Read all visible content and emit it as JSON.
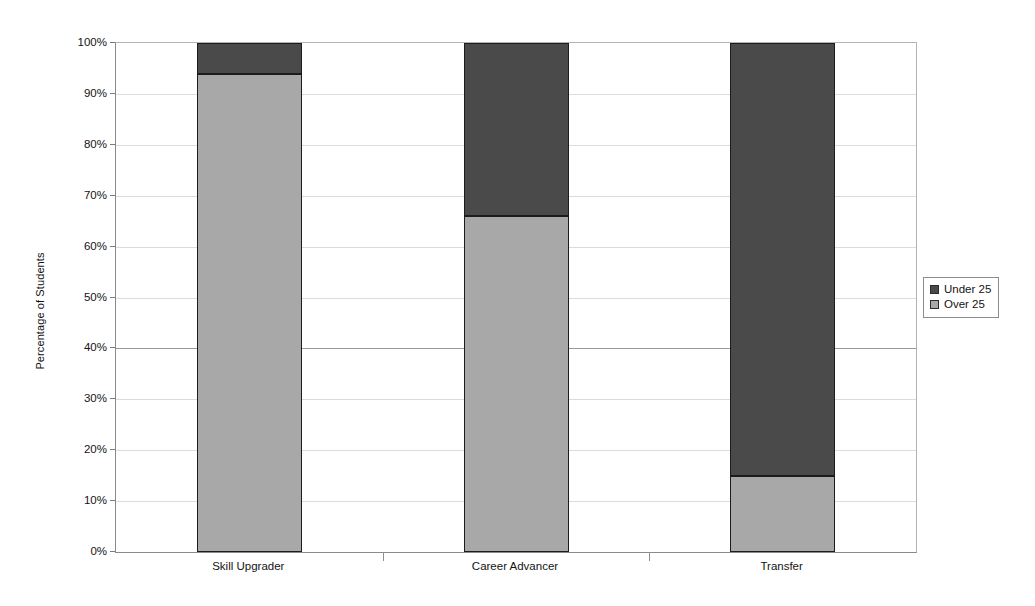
{
  "chart_data": {
    "type": "bar",
    "subtype": "stacked-100-percent",
    "title": "",
    "xlabel": "",
    "ylabel": "Percentage of Students",
    "categories": [
      "Skill Upgrader",
      "Career Advancer",
      "Transfer"
    ],
    "series": [
      {
        "name": "Under 25",
        "color": "#4a4a4a",
        "values": [
          6,
          34,
          85
        ]
      },
      {
        "name": "Over 25",
        "color": "#a8a8a8",
        "values": [
          94,
          66,
          15
        ]
      }
    ],
    "ylim": [
      0,
      100
    ],
    "y_tick_values": [
      0,
      10,
      20,
      30,
      40,
      50,
      60,
      70,
      80,
      90,
      100
    ],
    "y_tick_labels": [
      "0%",
      "10%",
      "20%",
      "30%",
      "40%",
      "50%",
      "60%",
      "70%",
      "80%",
      "90%",
      "100%"
    ],
    "grid": true,
    "grid_axis": "y",
    "legend_position": "right",
    "legend_entries": [
      "Under 25",
      "Over 25"
    ],
    "stack_order_bottom_to_top": [
      "Over 25",
      "Under 25"
    ]
  },
  "axes": {
    "y_title": "Percentage of Students",
    "y_ticks": [
      {
        "label": "100%",
        "value": 100
      },
      {
        "label": "90%",
        "value": 90
      },
      {
        "label": "80%",
        "value": 80
      },
      {
        "label": "70%",
        "value": 70
      },
      {
        "label": "60%",
        "value": 60
      },
      {
        "label": "50%",
        "value": 50
      },
      {
        "label": "40%",
        "value": 40
      },
      {
        "label": "30%",
        "value": 30
      },
      {
        "label": "20%",
        "value": 20
      },
      {
        "label": "10%",
        "value": 10
      },
      {
        "label": "0%",
        "value": 0
      }
    ],
    "x_ticks": [
      {
        "label": "Skill Upgrader"
      },
      {
        "label": "Career Advancer"
      },
      {
        "label": "Transfer"
      }
    ]
  },
  "legend": {
    "items": [
      {
        "label": "Under 25",
        "color": "#4a4a4a"
      },
      {
        "label": "Over 25",
        "color": "#a8a8a8"
      }
    ]
  },
  "colors": {
    "under_25": "#4a4a4a",
    "over_25": "#a8a8a8",
    "gridline": "#dcdcdc",
    "axis": "#8a8a8a",
    "bar_outline": "#1c1c1c",
    "background": "#ffffff"
  }
}
